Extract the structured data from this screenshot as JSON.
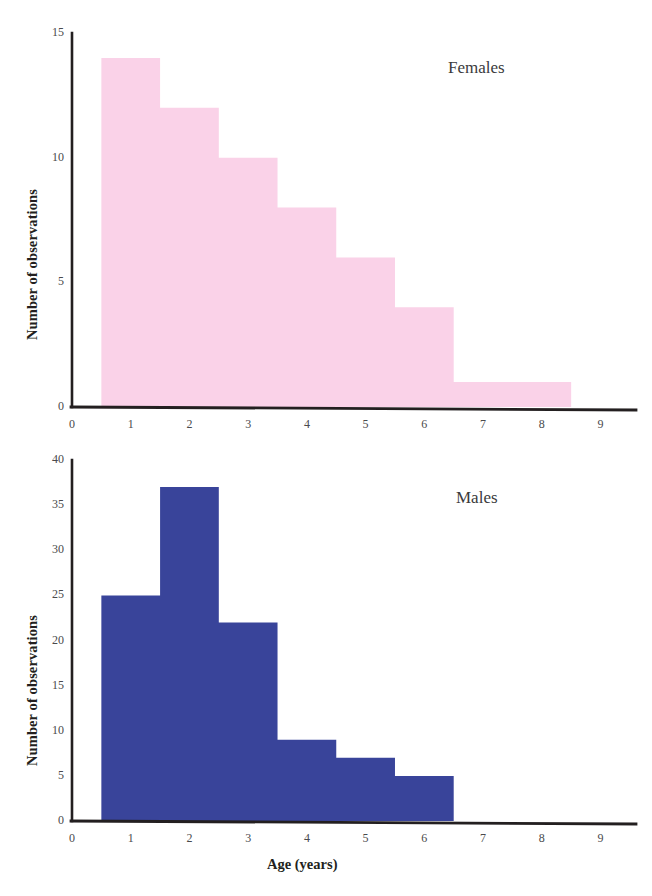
{
  "figure": {
    "axis_title_y": "Number of observations",
    "axis_title_x": "Age (years)",
    "colors": {
      "females_fill": "#fad2e8",
      "males_fill": "#39449a",
      "axis": "#231f20",
      "tick_text": "#4a4a4c",
      "label_text": "#3a3a3c",
      "background": "#ffffff"
    }
  },
  "chart_data": [
    {
      "type": "bar",
      "title": "Females",
      "xlabel": "",
      "ylabel": "Number of observations",
      "categories": [
        "1",
        "2",
        "3",
        "4",
        "5",
        "6",
        "7",
        "8"
      ],
      "bin_edges": [
        0.5,
        1.5,
        2.5,
        3.5,
        4.5,
        5.5,
        6.5,
        7.5,
        8.5
      ],
      "values": [
        14,
        12,
        10,
        8,
        6,
        4,
        1,
        1
      ],
      "xlim": [
        0,
        9.4
      ],
      "ylim": [
        0,
        15
      ],
      "xticks": [
        "0",
        "1",
        "2",
        "3",
        "4",
        "5",
        "6",
        "7",
        "8",
        "9"
      ],
      "xtick_values": [
        0,
        1,
        2,
        3,
        4,
        5,
        6,
        7,
        8,
        9
      ],
      "yticks": [
        "0",
        "5",
        "10",
        "15"
      ],
      "ytick_values": [
        0,
        5,
        10,
        15
      ],
      "grid": false,
      "legend": "none",
      "annotation": "Females"
    },
    {
      "type": "bar",
      "title": "Males",
      "xlabel": "Age (years)",
      "ylabel": "Number of observations",
      "categories": [
        "1",
        "2",
        "3",
        "4",
        "5",
        "6"
      ],
      "bin_edges": [
        0.5,
        1.5,
        2.5,
        3.5,
        4.5,
        5.5,
        6.5
      ],
      "values": [
        25,
        37,
        22,
        9,
        7,
        5
      ],
      "xlim": [
        0,
        9.4
      ],
      "ylim": [
        0,
        40
      ],
      "xticks": [
        "0",
        "1",
        "2",
        "3",
        "4",
        "5",
        "6",
        "7",
        "8",
        "9"
      ],
      "xtick_values": [
        0,
        1,
        2,
        3,
        4,
        5,
        6,
        7,
        8,
        9
      ],
      "yticks": [
        "0",
        "5",
        "10",
        "15",
        "20",
        "25",
        "30",
        "35",
        "40"
      ],
      "ytick_values": [
        0,
        5,
        10,
        15,
        20,
        25,
        30,
        35,
        40
      ],
      "grid": false,
      "legend": "none",
      "annotation": "Males"
    }
  ]
}
